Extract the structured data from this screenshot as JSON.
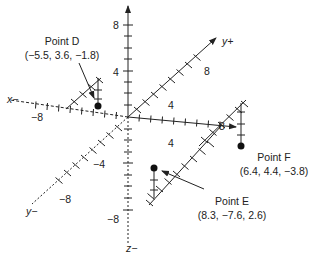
{
  "diagram": {
    "type": "3d-coordinate-system",
    "axes": {
      "x_pos_label": "",
      "x_neg_label": "x−",
      "y_pos_label": "y+",
      "y_neg_label": "y−",
      "z_pos_label": "",
      "z_neg_label": "z−"
    },
    "tick_labels": {
      "z_8": "8",
      "z_4": "4",
      "z_neg8": "−8",
      "x_neg8": "−8",
      "x_4": "4",
      "x_8": "8",
      "y_4": "4",
      "y_8": "8",
      "y_neg4": "−4",
      "y_neg8": "−8"
    },
    "points": [
      {
        "name": "Point D",
        "coords": "(−5.5, 3.6, −1.8)",
        "x": -5.5,
        "y": 3.6,
        "z": -1.8
      },
      {
        "name": "Point E",
        "coords": "(8.3, −7.6, 2.6)",
        "x": 8.3,
        "y": -7.6,
        "z": 2.6
      },
      {
        "name": "Point F",
        "coords": "(6.4, 4.4, −3.8)",
        "x": 6.4,
        "y": 4.4,
        "z": -3.8
      }
    ],
    "colors": {
      "line": "#222222",
      "point": "#111111",
      "background": "#ffffff"
    }
  }
}
